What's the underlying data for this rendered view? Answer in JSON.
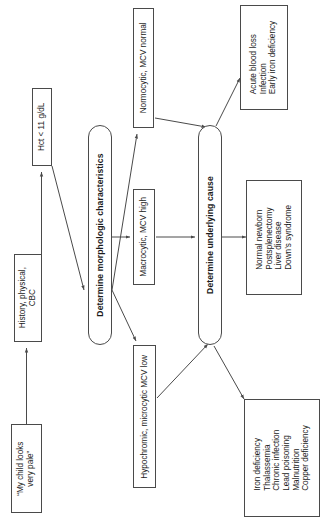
{
  "diagram": {
    "orientation": "text-rotated-90-ccw",
    "nodes": [
      {
        "id": "complaint",
        "label": "“My child looks\nvery pale”",
        "shape": "rect"
      },
      {
        "id": "workup",
        "label": "History, physical,\nCBC",
        "shape": "rect"
      },
      {
        "id": "hct",
        "label": "Hct < 11 g/dL",
        "shape": "rect"
      },
      {
        "id": "morphology",
        "label": "Determine morphologic characteristics",
        "shape": "rounded"
      },
      {
        "id": "normocytic",
        "label": "Normocytic, MCV normal",
        "shape": "rect"
      },
      {
        "id": "macrocytic",
        "label": "Macrocytic, MCV high",
        "shape": "rect"
      },
      {
        "id": "microcytic",
        "label": "Hypochromic, microcytic MCV low",
        "shape": "rect"
      },
      {
        "id": "cause",
        "label": "Determine underlying cause",
        "shape": "rounded"
      },
      {
        "id": "causes_normo",
        "label": "Acute blood loss\nInfection\nEarly iron deficiency",
        "shape": "rect"
      },
      {
        "id": "causes_macro",
        "label": "Normal newborn\nPostsplenectomy\nLiver disease\nDown’s syndrome",
        "shape": "rect"
      },
      {
        "id": "causes_micro",
        "label": "Iron deficiency\nThalassemia\nChronic infection\nLead poisoning\nMalnutrition\nCopper deficiency",
        "shape": "rect"
      }
    ],
    "edges": [
      {
        "from": "complaint",
        "to": "workup"
      },
      {
        "from": "workup",
        "to": "hct"
      },
      {
        "from": "hct",
        "to": "morphology"
      },
      {
        "from": "morphology",
        "to": "normocytic"
      },
      {
        "from": "morphology",
        "to": "macrocytic"
      },
      {
        "from": "morphology",
        "to": "microcytic"
      },
      {
        "from": "normocytic",
        "to": "cause"
      },
      {
        "from": "macrocytic",
        "to": "cause"
      },
      {
        "from": "microcytic",
        "to": "cause"
      },
      {
        "from": "cause",
        "to": "causes_normo"
      },
      {
        "from": "cause",
        "to": "causes_macro"
      },
      {
        "from": "cause",
        "to": "causes_micro"
      }
    ],
    "colors": {
      "line": "#4a4a4a",
      "text": "#1b1b1b",
      "background": "#ffffff"
    }
  }
}
